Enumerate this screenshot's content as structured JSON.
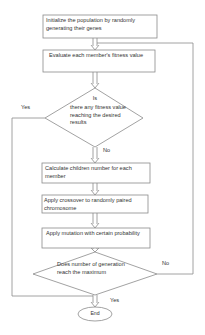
{
  "flowchart": {
    "nodes": [
      {
        "id": "init",
        "type": "process",
        "text": "Initialize the population by randomly generating their genes"
      },
      {
        "id": "evaluate",
        "type": "process",
        "text": "Evaluate each member's fitness value"
      },
      {
        "id": "decision1",
        "type": "decision",
        "text_line1": "Is",
        "text_line2": "there any fitness value reaching the desired results"
      },
      {
        "id": "children",
        "type": "process",
        "text": "Calculate children number for each member"
      },
      {
        "id": "crossover",
        "type": "process",
        "text": "Apply crossover to randomly paired chromosome"
      },
      {
        "id": "mutation",
        "type": "process",
        "text": "Apply mutation with certain probability"
      },
      {
        "id": "decision2",
        "type": "decision",
        "text": "Does number of generation reach the maximum"
      },
      {
        "id": "end",
        "type": "terminal",
        "text": "End"
      }
    ],
    "edge_labels": {
      "decision1_yes": "Yes",
      "decision1_no": "No",
      "decision2_no": "No",
      "decision2_yes": "Yes"
    },
    "colors": {
      "stroke": "#8a8a8a",
      "text": "#333333",
      "background": "#ffffff"
    }
  }
}
